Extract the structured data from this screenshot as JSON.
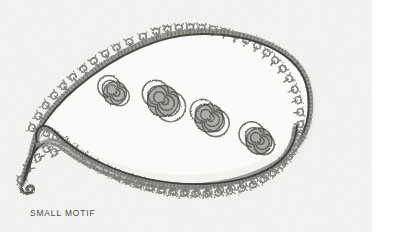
{
  "page": {
    "background_color": "#ffffff",
    "width": 394,
    "height": 248
  },
  "photo": {
    "name": "embroidery-photograph",
    "x": 0,
    "y": 0,
    "width": 372,
    "height": 232,
    "fabric_color": "#f4f4f2",
    "subject": "embroidered paisley motif",
    "technique": "corded outline with picot loop edging and coiled spiral fillings"
  },
  "caption": {
    "text": "SMALL MOTIF",
    "color": "#4c4c4c"
  },
  "motif": {
    "name": "paisley-motif",
    "thread_color_light": "#9a9a96",
    "thread_color_mid": "#76766f",
    "thread_color_dark": "#464641",
    "cord_color": "#3a3a36",
    "body_fill": "#fafaf8",
    "outer_outline": {
      "name": "paisley-outer-outline",
      "description": "closed teardrop contour with outward picot loops",
      "picot_count": 58
    },
    "inner_outline": {
      "name": "paisley-inner-cord",
      "description": "inner crescent cord with downward picot loops",
      "picot_count": 26
    },
    "spirals": [
      {
        "name": "spiral-1",
        "cx": 115,
        "cy": 93,
        "r": 11.5
      },
      {
        "name": "spiral-2",
        "cx": 163,
        "cy": 101,
        "r": 15.5
      },
      {
        "name": "spiral-3",
        "cx": 209,
        "cy": 118,
        "r": 14.0
      },
      {
        "name": "spiral-4",
        "cx": 259,
        "cy": 141,
        "r": 13.0
      }
    ]
  }
}
